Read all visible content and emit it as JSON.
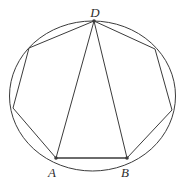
{
  "diagram": {
    "background_color": "#ffffff",
    "stroke_color": "#3b3b3b",
    "stroke_width": 1,
    "circle": {
      "cx": 92.5,
      "cy": 96,
      "rx": 83,
      "ry": 75
    },
    "points": {
      "D": {
        "x": 94,
        "y": 21
      },
      "TR": {
        "x": 155,
        "y": 49
      },
      "R": {
        "x": 172,
        "y": 110
      },
      "B": {
        "x": 127,
        "y": 158
      },
      "A": {
        "x": 56,
        "y": 158
      },
      "L": {
        "x": 13,
        "y": 108
      },
      "TL": {
        "x": 29,
        "y": 48
      }
    },
    "polygon_order": [
      "D",
      "TR",
      "R",
      "B",
      "A",
      "L",
      "TL"
    ],
    "triangle_vertices": [
      "D",
      "A",
      "B"
    ],
    "dot_vertices": [
      "D",
      "A",
      "B"
    ],
    "dot_radius": 1.8,
    "labels": [
      {
        "text": "D",
        "x": 95,
        "y": 17,
        "anchor": "middle"
      },
      {
        "text": "A",
        "x": 52,
        "y": 177,
        "anchor": "middle"
      },
      {
        "text": "B",
        "x": 125,
        "y": 177,
        "anchor": "middle"
      }
    ]
  }
}
